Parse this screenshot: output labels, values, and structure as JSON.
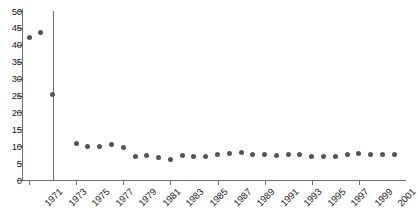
{
  "chart_data": {
    "type": "scatter",
    "title": "",
    "subtitle": "",
    "xlabel": "",
    "ylabel": "",
    "xlim": [
      1970.4,
      2003.0
    ],
    "ylim": [
      0,
      50
    ],
    "grid": false,
    "legend": null,
    "marker": {
      "shape": "circle",
      "color": "#555555",
      "size": 5
    },
    "y_ticks": [
      0,
      5,
      10,
      15,
      20,
      25,
      30,
      35,
      40,
      45,
      50
    ],
    "y_tick_labels": [
      "0",
      "5",
      "10",
      "15",
      "20",
      "25",
      "30",
      "35",
      "40",
      "45",
      "50"
    ],
    "x_ticks": [
      1971,
      1975,
      1979,
      1983,
      1987,
      1991,
      1995,
      1999
    ],
    "x_tick_labels": [
      "1971",
      "1973",
      "1975",
      "1977",
      "1979",
      "1981",
      "1983",
      "1985",
      "1987",
      "1989",
      "1991",
      "1993",
      "1995",
      "1997",
      "1999",
      "2001"
    ],
    "x_label_years": [
      1971,
      1973,
      1975,
      1977,
      1979,
      1981,
      1983,
      1985,
      1987,
      1989,
      1991,
      1993,
      1995,
      1997,
      1999,
      2001
    ],
    "annotations": [
      {
        "type": "vline",
        "x": 1973,
        "color": "#6e6e6e",
        "y_from": 0,
        "y_to": 50
      }
    ],
    "x": [
      1971,
      1972,
      1973,
      1975,
      1976,
      1977,
      1978,
      1979,
      1980,
      1981,
      1982,
      1983,
      1984,
      1985,
      1986,
      1987,
      1988,
      1989,
      1990,
      1991,
      1992,
      1993,
      1994,
      1995,
      1996,
      1997,
      1998,
      1999,
      2000,
      2001,
      2002
    ],
    "values": [
      42.1,
      43.5,
      25.2,
      10.8,
      9.9,
      9.8,
      10.4,
      9.7,
      7.1,
      7.2,
      6.7,
      6.1,
      7.3,
      7.0,
      6.9,
      7.5,
      7.8,
      8.0,
      7.4,
      7.5,
      7.2,
      7.5,
      7.4,
      7.1,
      7.0,
      7.1,
      7.5,
      7.8,
      7.5,
      7.4,
      7.4
    ],
    "categories": [
      "1971",
      "1972",
      "1973",
      "1975",
      "1976",
      "1977",
      "1978",
      "1979",
      "1980",
      "1981",
      "1982",
      "1983",
      "1984",
      "1985",
      "1986",
      "1987",
      "1988",
      "1989",
      "1990",
      "1991",
      "1992",
      "1993",
      "1994",
      "1995",
      "1996",
      "1997",
      "1998",
      "1999",
      "2000",
      "2001",
      "2002"
    ]
  }
}
